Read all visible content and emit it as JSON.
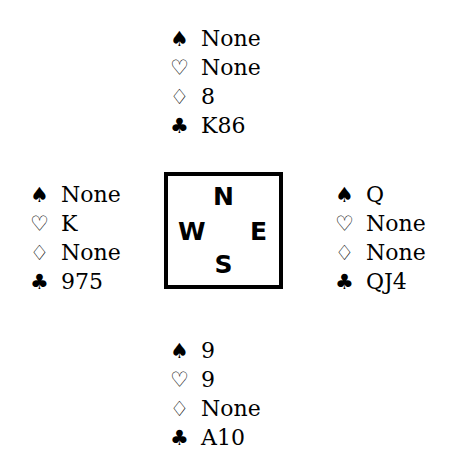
{
  "diagram": {
    "type": "bridge-hand-diagram",
    "background_color": "#ffffff",
    "ink_color": "#000000"
  },
  "suits": {
    "spade": {
      "glyph": "♠",
      "name": "spade-symbol",
      "style": "filled"
    },
    "heart": {
      "glyph": "♡",
      "name": "heart-symbol",
      "style": "hollow"
    },
    "diamond": {
      "glyph": "♢",
      "name": "diamond-symbol",
      "style": "hollow"
    },
    "club": {
      "glyph": "♣",
      "name": "club-symbol",
      "style": "filled"
    }
  },
  "compass": {
    "north_label": "N",
    "west_label": "W",
    "east_label": "E",
    "south_label": "S"
  },
  "hands": {
    "north": {
      "position": "North",
      "spades": "None",
      "hearts": "None",
      "diamonds": "8",
      "clubs": "K86"
    },
    "west": {
      "position": "West",
      "spades": "None",
      "hearts": "K",
      "diamonds": "None",
      "clubs": "975"
    },
    "east": {
      "position": "East",
      "spades": "Q",
      "hearts": "None",
      "diamonds": "None",
      "clubs": "QJ4"
    },
    "south": {
      "position": "South",
      "spades": "9",
      "hearts": "9",
      "diamonds": "None",
      "clubs": "A10"
    }
  }
}
